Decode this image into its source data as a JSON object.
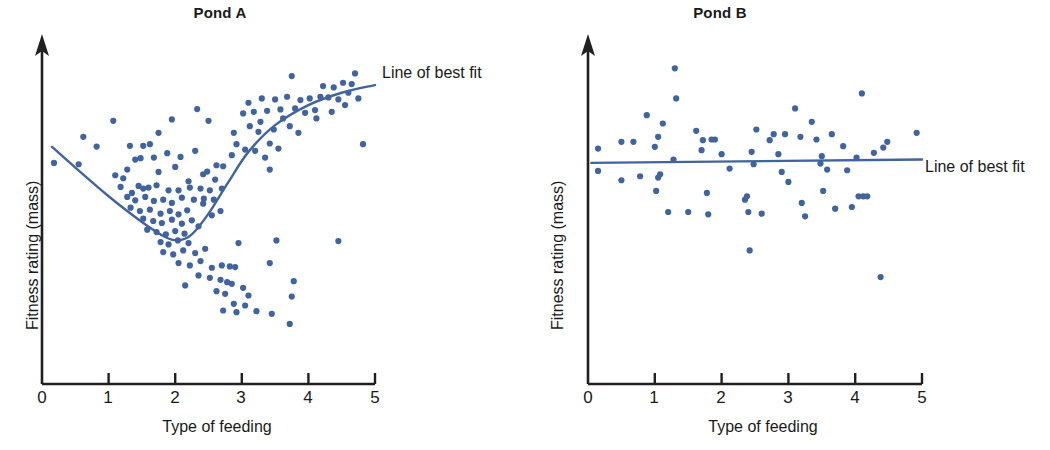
{
  "figure": {
    "accent_color": "#41639e",
    "axis_color": "#231f20",
    "background": "#ffffff"
  },
  "panels": [
    {
      "id": "pond-a",
      "title": "Pond A",
      "xlabel": "Type of feeding",
      "ylabel": "Fitness rating (mass)",
      "fit_label": "Line of best fit",
      "xticks": [
        "0",
        "1",
        "2",
        "3",
        "4",
        "5"
      ]
    },
    {
      "id": "pond-b",
      "title": "Pond B",
      "xlabel": "Type of feeding",
      "ylabel": "Fitness rating (mass)",
      "fit_label": "Line of best fit",
      "xticks": [
        "0",
        "1",
        "2",
        "3",
        "4",
        "5"
      ]
    }
  ],
  "chart_data": [
    {
      "type": "scatter",
      "title": "Pond A",
      "xlabel": "Type of feeding",
      "ylabel": "Fitness rating (mass)",
      "xlim": [
        0,
        5
      ],
      "ylim": [
        0,
        10
      ],
      "xticks": [
        0,
        1,
        2,
        3,
        4,
        5
      ],
      "yticks": [],
      "grid": false,
      "legend": "Line of best fit",
      "legend_position": "upper-right-outside",
      "series": [
        {
          "name": "Pond A individuals",
          "marker_color": "#41639e",
          "points": [
            [
              0.18,
              6.62
            ],
            [
              0.62,
              7.4
            ],
            [
              1.07,
              7.88
            ],
            [
              0.82,
              7.11
            ],
            [
              1.1,
              6.25
            ],
            [
              1.32,
              7.13
            ],
            [
              1.52,
              7.13
            ],
            [
              0.55,
              6.58
            ],
            [
              1.88,
              6.91
            ],
            [
              2.08,
              6.8
            ],
            [
              1.75,
              7.52
            ],
            [
              2.33,
              8.23
            ],
            [
              1.95,
              7.92
            ],
            [
              1.22,
              6.16
            ],
            [
              1.4,
              6.72
            ],
            [
              1.48,
              6.76
            ],
            [
              1.28,
              6.42
            ],
            [
              1.68,
              6.78
            ],
            [
              1.75,
              6.35
            ],
            [
              2.0,
              6.5
            ],
            [
              2.2,
              6.07
            ],
            [
              2.42,
              6.28
            ],
            [
              2.48,
              6.36
            ],
            [
              2.6,
              6.12
            ],
            [
              1.18,
              5.9
            ],
            [
              1.35,
              5.72
            ],
            [
              1.52,
              5.85
            ],
            [
              1.6,
              5.88
            ],
            [
              1.45,
              5.93
            ],
            [
              1.72,
              5.95
            ],
            [
              1.9,
              5.8
            ],
            [
              2.05,
              5.8
            ],
            [
              2.22,
              5.88
            ],
            [
              2.38,
              5.85
            ],
            [
              2.52,
              5.8
            ],
            [
              1.28,
              5.6
            ],
            [
              1.4,
              5.5
            ],
            [
              1.55,
              5.6
            ],
            [
              1.68,
              5.48
            ],
            [
              1.82,
              5.52
            ],
            [
              1.95,
              5.42
            ],
            [
              2.1,
              5.58
            ],
            [
              2.28,
              5.52
            ],
            [
              2.43,
              5.55
            ],
            [
              1.33,
              5.28
            ],
            [
              1.47,
              5.18
            ],
            [
              1.62,
              5.22
            ],
            [
              1.78,
              5.1
            ],
            [
              1.92,
              5.18
            ],
            [
              2.05,
              5.08
            ],
            [
              2.18,
              5.2
            ],
            [
              1.52,
              4.95
            ],
            [
              1.67,
              4.88
            ],
            [
              1.8,
              4.82
            ],
            [
              1.95,
              4.92
            ],
            [
              2.1,
              4.8
            ],
            [
              2.25,
              4.9
            ],
            [
              1.58,
              4.62
            ],
            [
              1.72,
              4.55
            ],
            [
              1.86,
              4.48
            ],
            [
              2.0,
              4.58
            ],
            [
              2.14,
              4.5
            ],
            [
              1.78,
              4.25
            ],
            [
              1.9,
              4.18
            ],
            [
              2.04,
              4.3
            ],
            [
              2.2,
              4.22
            ],
            [
              1.82,
              3.95
            ],
            [
              1.97,
              3.88
            ],
            [
              2.12,
              4.0
            ],
            [
              2.3,
              3.92
            ],
            [
              2.45,
              4.05
            ],
            [
              2.05,
              3.62
            ],
            [
              2.22,
              3.55
            ],
            [
              2.38,
              3.68
            ],
            [
              2.55,
              3.48
            ],
            [
              2.7,
              3.55
            ],
            [
              2.82,
              3.52
            ],
            [
              2.9,
              3.5
            ],
            [
              2.35,
              3.25
            ],
            [
              2.52,
              3.18
            ],
            [
              2.68,
              3.12
            ],
            [
              2.78,
              3.05
            ],
            [
              2.85,
              3.0
            ],
            [
              2.15,
              2.95
            ],
            [
              2.62,
              2.78
            ],
            [
              2.75,
              2.7
            ],
            [
              3.02,
              2.88
            ],
            [
              3.1,
              2.65
            ],
            [
              2.88,
              2.4
            ],
            [
              3.05,
              2.35
            ],
            [
              2.72,
              2.2
            ],
            [
              2.92,
              2.15
            ],
            [
              3.22,
              2.18
            ],
            [
              3.45,
              2.1
            ],
            [
              3.72,
              1.8
            ],
            [
              3.75,
              2.62
            ],
            [
              3.78,
              3.08
            ],
            [
              3.42,
              3.62
            ],
            [
              2.95,
              4.22
            ],
            [
              2.7,
              5.85
            ],
            [
              2.62,
              6.55
            ],
            [
              2.72,
              6.52
            ],
            [
              2.88,
              7.52
            ],
            [
              2.92,
              7.18
            ],
            [
              2.85,
              6.85
            ],
            [
              3.02,
              8.1
            ],
            [
              3.1,
              8.42
            ],
            [
              3.18,
              8.15
            ],
            [
              3.12,
              7.72
            ],
            [
              3.25,
              7.55
            ],
            [
              3.05,
              7.02
            ],
            [
              3.2,
              6.98
            ],
            [
              3.3,
              8.55
            ],
            [
              3.38,
              8.18
            ],
            [
              3.28,
              7.85
            ],
            [
              3.42,
              7.2
            ],
            [
              3.35,
              6.78
            ],
            [
              3.5,
              8.52
            ],
            [
              3.58,
              8.22
            ],
            [
              3.48,
              7.62
            ],
            [
              3.62,
              7.95
            ],
            [
              3.55,
              7.05
            ],
            [
              3.42,
              6.42
            ],
            [
              3.68,
              8.6
            ],
            [
              3.75,
              9.22
            ],
            [
              3.8,
              8.25
            ],
            [
              3.72,
              7.72
            ],
            [
              3.88,
              8.5
            ],
            [
              3.95,
              8.12
            ],
            [
              3.85,
              7.52
            ],
            [
              4.02,
              8.55
            ],
            [
              4.1,
              8.2
            ],
            [
              4.18,
              8.6
            ],
            [
              4.22,
              8.92
            ],
            [
              4.12,
              7.95
            ],
            [
              4.3,
              8.58
            ],
            [
              4.38,
              8.88
            ],
            [
              4.45,
              8.52
            ],
            [
              4.35,
              8.15
            ],
            [
              4.52,
              9.02
            ],
            [
              4.6,
              8.72
            ],
            [
              4.55,
              8.35
            ],
            [
              4.7,
              9.3
            ],
            [
              4.65,
              8.98
            ],
            [
              4.75,
              8.55
            ],
            [
              4.82,
              7.18
            ],
            [
              4.45,
              4.28
            ],
            [
              3.52,
              4.3
            ],
            [
              2.5,
              7.88
            ],
            [
              2.3,
              6.98
            ],
            [
              1.62,
              7.18
            ],
            [
              2.55,
              5.05
            ],
            [
              2.68,
              5.18
            ],
            [
              2.42,
              5.4
            ],
            [
              2.58,
              5.52
            ],
            [
              2.35,
              4.72
            ]
          ]
        }
      ],
      "fit_line": {
        "name": "Line of best fit",
        "color": "#41639e",
        "shape": "u-curve",
        "description": "Decreases from x=0.15 to a minimum near x=2.0, then rises steeply and flattens toward x=5",
        "points": [
          [
            0.15,
            7.1
          ],
          [
            0.5,
            6.48
          ],
          [
            1.0,
            5.62
          ],
          [
            1.5,
            4.85
          ],
          [
            1.85,
            4.4
          ],
          [
            2.05,
            4.3
          ],
          [
            2.25,
            4.48
          ],
          [
            2.5,
            5.1
          ],
          [
            2.8,
            6.05
          ],
          [
            3.1,
            6.95
          ],
          [
            3.5,
            7.75
          ],
          [
            4.0,
            8.35
          ],
          [
            4.5,
            8.72
          ],
          [
            5.0,
            8.95
          ]
        ]
      }
    },
    {
      "type": "scatter",
      "title": "Pond B",
      "xlabel": "Type of feeding",
      "ylabel": "Fitness rating (mass)",
      "xlim": [
        0,
        5
      ],
      "ylim": [
        0,
        10
      ],
      "xticks": [
        0,
        1,
        2,
        3,
        4,
        5
      ],
      "yticks": [],
      "grid": false,
      "legend": "Line of best fit",
      "legend_position": "right-outside",
      "series": [
        {
          "name": "Pond B individuals",
          "marker_color": "#41639e",
          "points": [
            [
              0.15,
              7.05
            ],
            [
              0.15,
              6.38
            ],
            [
              0.5,
              7.25
            ],
            [
              0.5,
              6.1
            ],
            [
              0.68,
              7.25
            ],
            [
              0.78,
              6.22
            ],
            [
              0.88,
              8.05
            ],
            [
              1.0,
              7.1
            ],
            [
              1.05,
              7.4
            ],
            [
              1.08,
              6.28
            ],
            [
              1.05,
              6.18
            ],
            [
              1.02,
              5.78
            ],
            [
              1.12,
              7.8
            ],
            [
              1.3,
              9.45
            ],
            [
              1.32,
              8.55
            ],
            [
              1.28,
              6.72
            ],
            [
              1.2,
              5.15
            ],
            [
              1.5,
              5.15
            ],
            [
              1.62,
              7.58
            ],
            [
              1.7,
              7.0
            ],
            [
              1.72,
              7.3
            ],
            [
              1.78,
              5.72
            ],
            [
              1.8,
              5.08
            ],
            [
              1.85,
              7.32
            ],
            [
              1.9,
              7.32
            ],
            [
              2.0,
              6.88
            ],
            [
              2.12,
              6.45
            ],
            [
              2.35,
              5.52
            ],
            [
              2.38,
              5.62
            ],
            [
              2.4,
              5.15
            ],
            [
              2.45,
              6.95
            ],
            [
              2.42,
              4.0
            ],
            [
              2.48,
              6.58
            ],
            [
              2.52,
              7.62
            ],
            [
              2.6,
              5.1
            ],
            [
              2.72,
              7.3
            ],
            [
              2.78,
              7.48
            ],
            [
              2.85,
              6.88
            ],
            [
              2.9,
              6.35
            ],
            [
              2.95,
              7.48
            ],
            [
              3.0,
              6.05
            ],
            [
              3.1,
              8.25
            ],
            [
              3.18,
              7.4
            ],
            [
              3.2,
              5.42
            ],
            [
              3.25,
              5.02
            ],
            [
              3.35,
              7.85
            ],
            [
              3.42,
              7.32
            ],
            [
              3.48,
              6.6
            ],
            [
              3.5,
              6.82
            ],
            [
              3.52,
              5.78
            ],
            [
              3.58,
              6.42
            ],
            [
              3.65,
              7.48
            ],
            [
              3.7,
              5.25
            ],
            [
              3.82,
              7.12
            ],
            [
              3.88,
              6.4
            ],
            [
              3.95,
              5.3
            ],
            [
              4.02,
              6.78
            ],
            [
              4.05,
              5.62
            ],
            [
              4.1,
              8.7
            ],
            [
              4.12,
              5.62
            ],
            [
              4.18,
              5.62
            ],
            [
              4.28,
              6.92
            ],
            [
              4.38,
              3.2
            ],
            [
              4.42,
              7.08
            ],
            [
              4.48,
              7.25
            ],
            [
              4.92,
              7.52
            ]
          ]
        }
      ],
      "fit_line": {
        "name": "Line of best fit",
        "color": "#41639e",
        "shape": "horizontal",
        "description": "Essentially flat horizontal line indicating no relationship",
        "points": [
          [
            0.05,
            6.62
          ],
          [
            5.0,
            6.72
          ]
        ]
      }
    }
  ]
}
